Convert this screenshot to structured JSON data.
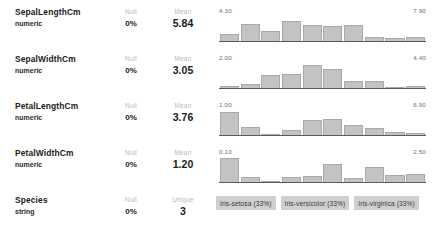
{
  "panel": {
    "title": "Dataset column profile"
  },
  "columns": [
    {
      "name": "SepalLengthCm",
      "type": "numeric",
      "null_label": "Null",
      "null_value": "0%",
      "stat_label": "Mean",
      "stat_value": "5.84",
      "viz": "histogram"
    },
    {
      "name": "SepalWidthCm",
      "type": "numeric",
      "null_label": "Null",
      "null_value": "0%",
      "stat_label": "Mean",
      "stat_value": "3.05",
      "viz": "histogram"
    },
    {
      "name": "PetalLengthCm",
      "type": "numeric",
      "null_label": "Null",
      "null_value": "0%",
      "stat_label": "Mean",
      "stat_value": "3.76",
      "viz": "histogram"
    },
    {
      "name": "PetalWidthCm",
      "type": "numeric",
      "null_label": "Null",
      "null_value": "0%",
      "stat_label": "Mean",
      "stat_value": "1.20",
      "viz": "histogram"
    },
    {
      "name": "Species",
      "type": "string",
      "null_label": "Null",
      "null_value": "0%",
      "stat_label": "Unique",
      "stat_value": "3",
      "viz": "chips"
    }
  ],
  "categories": [
    {
      "label": "Iris-setosa (33%)"
    },
    {
      "label": "Iris-versicolor (33%)"
    },
    {
      "label": "Iris-virginica (33%)"
    }
  ],
  "colors": {
    "bar_fill": "#c3c3c3",
    "bar_stroke": "#a9a9a9",
    "axis_line": "#5b5b5b",
    "chip_bg": "#cfcfcf",
    "label_muted": "#b9b9b9",
    "text": "#1a1a1a",
    "background": "#ffffff"
  },
  "chart_data": [
    {
      "type": "bar",
      "title": "SepalLengthCm",
      "xlabel": "",
      "ylabel": "count",
      "axis_min": "4.30",
      "axis_max": "7.90",
      "xlim": [
        4.3,
        7.9
      ],
      "ylim": [
        0,
        32
      ],
      "grid": false,
      "legend": "none",
      "categories": [
        "4.30",
        "4.66",
        "5.02",
        "5.38",
        "5.74",
        "6.10",
        "6.46",
        "6.82",
        "7.18",
        "7.54"
      ],
      "values": [
        9,
        23,
        14,
        27,
        22,
        20,
        21,
        5,
        4,
        5
      ]
    },
    {
      "type": "bar",
      "title": "SepalWidthCm",
      "xlabel": "",
      "ylabel": "count",
      "axis_min": "2.00",
      "axis_max": "4.40",
      "xlim": [
        2.0,
        4.4
      ],
      "ylim": [
        0,
        40
      ],
      "grid": false,
      "legend": "none",
      "categories": [
        "2.00",
        "2.24",
        "2.48",
        "2.72",
        "2.96",
        "3.20",
        "3.44",
        "3.68",
        "3.92",
        "4.16"
      ],
      "values": [
        4,
        7,
        22,
        24,
        38,
        31,
        11,
        12,
        2,
        3
      ]
    },
    {
      "type": "bar",
      "title": "PetalLengthCm",
      "xlabel": "",
      "ylabel": "count",
      "axis_min": "1.00",
      "axis_max": "6.90",
      "xlim": [
        1.0,
        6.9
      ],
      "ylim": [
        0,
        38
      ],
      "grid": false,
      "legend": "none",
      "categories": [
        "1.00",
        "1.59",
        "2.18",
        "2.77",
        "3.36",
        "3.95",
        "4.54",
        "5.13",
        "5.72",
        "6.31"
      ],
      "values": [
        37,
        13,
        2,
        8,
        24,
        25,
        16,
        11,
        4,
        3
      ]
    },
    {
      "type": "bar",
      "title": "PetalWidthCm",
      "xlabel": "",
      "ylabel": "count",
      "axis_min": "0.10",
      "axis_max": "2.50",
      "xlim": [
        0.1,
        2.5
      ],
      "ylim": [
        0,
        34
      ],
      "grid": false,
      "legend": "none",
      "categories": [
        "0.10",
        "0.34",
        "0.58",
        "0.82",
        "1.06",
        "1.30",
        "1.54",
        "1.78",
        "2.02",
        "2.26"
      ],
      "values": [
        34,
        7,
        1,
        7,
        8,
        26,
        5,
        21,
        10,
        12
      ]
    },
    {
      "type": "bar",
      "title": "Species",
      "xlabel": "",
      "ylabel": "share",
      "grid": false,
      "legend": "none",
      "categories": [
        "Iris-setosa",
        "Iris-versicolor",
        "Iris-virginica"
      ],
      "values": [
        33,
        33,
        33
      ]
    }
  ]
}
